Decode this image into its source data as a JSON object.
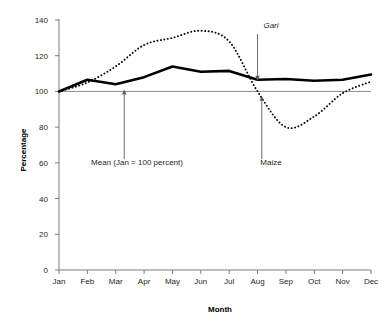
{
  "chart_data": {
    "type": "line",
    "title": "",
    "xlabel": "Month",
    "ylabel": "Percentage",
    "categories": [
      "Jan",
      "Feb",
      "Mar",
      "Apr",
      "May",
      "Jun",
      "Jul",
      "Aug",
      "Sep",
      "Oct",
      "Nov",
      "Dec"
    ],
    "xlim": [
      0,
      11
    ],
    "ylim": [
      0,
      140
    ],
    "yticks": [
      0,
      20,
      40,
      60,
      80,
      100,
      120,
      140
    ],
    "ytick_labels": [
      "0",
      "20",
      "40",
      "60",
      "80",
      "100",
      "120",
      "140"
    ],
    "grid": false,
    "legend": "none (series labeled by arrow annotations)",
    "reference_line": {
      "name": "Mean (Jan = 100 percent)",
      "value": 100,
      "orientation": "horizontal"
    },
    "series": [
      {
        "name": "Gari",
        "style": "solid-thick",
        "color": "#000000",
        "values": [
          100,
          106.5,
          104,
          108,
          114,
          111,
          111.5,
          106.5,
          107,
          106,
          106.5,
          109.5
        ]
      },
      {
        "name": "Maize",
        "style": "dotted",
        "color": "#000000",
        "values": [
          100,
          105,
          114,
          126,
          130,
          134,
          128,
          100,
          80,
          86,
          99,
          105.5
        ]
      }
    ],
    "annotations": [
      {
        "label": "Gari",
        "italic": true,
        "target_series": "Gari",
        "target_month": "Aug",
        "arrow_direction": "down"
      },
      {
        "label": "Mean (Jan = 100 percent)",
        "italic": false,
        "target_series": "reference_line",
        "target_month": "Mar",
        "arrow_direction": "up"
      },
      {
        "label": "Maize",
        "italic": false,
        "target_series": "Maize",
        "target_month": "Aug",
        "arrow_direction": "up"
      }
    ]
  },
  "colors": {
    "background": "#ffffff",
    "axis": "#6d6e71",
    "text": "#231f20",
    "series": "#000000",
    "annotation": "#58595b"
  }
}
